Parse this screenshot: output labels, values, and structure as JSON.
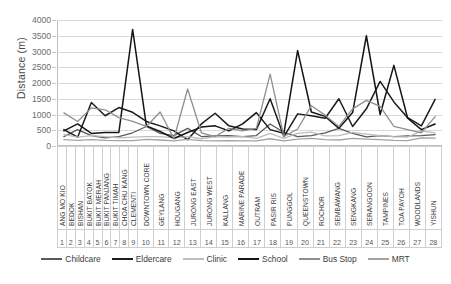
{
  "chart_data": {
    "type": "line",
    "title": "",
    "xlabel": "",
    "ylabel": "Distance (m)",
    "ylim": [
      0,
      4000
    ],
    "ytick_step": 500,
    "yticks": [
      4000,
      3500,
      3000,
      2500,
      2000,
      1500,
      1000,
      500,
      0
    ],
    "grid": true,
    "legend_position": "bottom",
    "categories": [
      "ANG MO KIO",
      "BEDOK",
      "BISHAN",
      "BUKIT BATOK",
      "BUKIT MERAH",
      "BUKIT PANJANG",
      "BUKIT TIMAH",
      "CHOA CHU KANG",
      "CLEMENTI",
      "DOWNTOWN CORE",
      "GEYLANG",
      "HOUGANG",
      "JURONG EAST",
      "JURONG WEST",
      "KALLANG",
      "MARINE PARADE",
      "OUTRAM",
      "PASIR RIS",
      "PUNGGOL",
      "QUEENSTOWN",
      "ROCHOR",
      "SEMBAWANG",
      "SENGKANG",
      "SERANGOON",
      "TAMPINES",
      "TOA PAYOH",
      "WOODLANDS",
      "YISHUN"
    ],
    "category_numbers": [
      "1",
      "2",
      "3",
      "4",
      "5",
      "6",
      "7",
      "8",
      "9",
      "10",
      "11",
      "12",
      "13",
      "14",
      "15",
      "16",
      "17",
      "18",
      "19",
      "20",
      "21",
      "22",
      "23",
      "24",
      "25",
      "26",
      "27",
      "28"
    ],
    "series": [
      {
        "name": "Childcare",
        "color": "#5a5a5a",
        "values": [
          300,
          520,
          330,
          260,
          300,
          420,
          620,
          400,
          330,
          560,
          300,
          320,
          330,
          300,
          330,
          700,
          430,
          300,
          330,
          420,
          560,
          400,
          290,
          330,
          300,
          320,
          330,
          360
        ]
      },
      {
        "name": "Eldercare",
        "color": "#1c1c1c",
        "values": [
          520,
          280,
          1380,
          960,
          1220,
          1070,
          780,
          640,
          480,
          200,
          700,
          1040,
          640,
          540,
          520,
          1500,
          300,
          1020,
          960,
          880,
          1500,
          620,
          1180,
          2050,
          1400,
          900,
          640,
          1480
        ]
      },
      {
        "name": "Clinic",
        "color": "#bdbdbd",
        "values": [
          360,
          280,
          330,
          300,
          260,
          280,
          300,
          300,
          260,
          300,
          230,
          300,
          280,
          300,
          240,
          400,
          240,
          400,
          440,
          320,
          330,
          430,
          380,
          330,
          300,
          280,
          480,
          420
        ]
      },
      {
        "name": "School",
        "color": "#151515",
        "values": [
          480,
          700,
          400,
          430,
          430,
          3700,
          640,
          460,
          240,
          430,
          600,
          640,
          480,
          700,
          1060,
          520,
          400,
          3030,
          1080,
          940,
          560,
          1060,
          3500,
          1000,
          2560,
          880,
          520,
          700
        ]
      },
      {
        "name": "Bus Stop",
        "color": "#8f8f8f",
        "values": [
          1050,
          780,
          1210,
          1150,
          900,
          780,
          620,
          1080,
          230,
          1810,
          420,
          300,
          560,
          480,
          560,
          2280,
          300,
          540,
          1280,
          980,
          620,
          1180,
          1450,
          1260,
          620,
          520,
          420,
          930
        ]
      },
      {
        "name": "MRT",
        "color": "#a3a3a3",
        "values": [
          200,
          180,
          200,
          180,
          170,
          170,
          210,
          190,
          160,
          210,
          170,
          160,
          170,
          160,
          160,
          230,
          160,
          220,
          240,
          200,
          190,
          240,
          220,
          200,
          180,
          170,
          260,
          250
        ]
      }
    ]
  },
  "legend": {
    "items": [
      {
        "label": "Childcare"
      },
      {
        "label": "Eldercare"
      },
      {
        "label": "Clinic"
      },
      {
        "label": "School"
      },
      {
        "label": "Bus Stop"
      },
      {
        "label": "MRT"
      }
    ]
  }
}
